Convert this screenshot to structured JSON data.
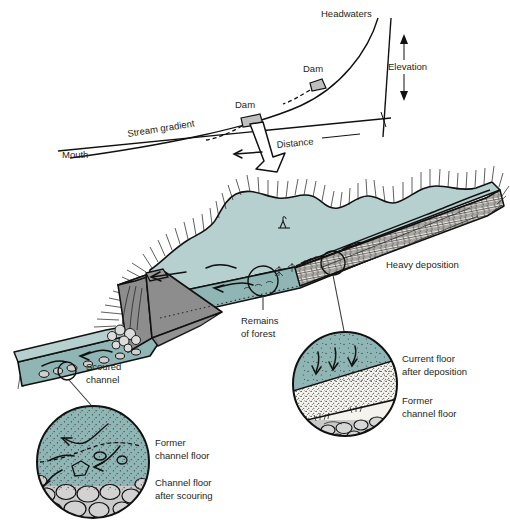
{
  "figure": {
    "colors": {
      "water_surface": "#b6d0cf",
      "water_body": "#8fb5b5",
      "dam_gray": "#8d8d8d",
      "cobble_gray": "#c9c9c9",
      "sediment_white": "#f5f3ee",
      "ink": "#231f20"
    }
  },
  "profile": {
    "headwaters_label": "Headwaters",
    "dam_upper_label": "Dam",
    "dam_lower_label": "Dam",
    "elevation_label": "Elevation",
    "distance_label": "Distance",
    "stream_gradient_label": "Stream gradient",
    "mouth_label": "Mouth"
  },
  "scene": {
    "heavy_deposition_label": "Heavy deposition",
    "remains_of_forest_label_1": "Remains",
    "remains_of_forest_label_2": "of forest",
    "scoured_channel_label_1": "Scoured",
    "scoured_channel_label_2": "channel"
  },
  "inset_deposition": {
    "current_floor_label_1": "Current floor",
    "current_floor_label_2": "after deposition",
    "former_floor_label_1": "Former",
    "former_floor_label_2": "channel floor"
  },
  "inset_scour": {
    "former_floor_label_1": "Former",
    "former_floor_label_2": "channel floor",
    "after_scouring_label_1": "Channel floor",
    "after_scouring_label_2": "after scouring"
  }
}
